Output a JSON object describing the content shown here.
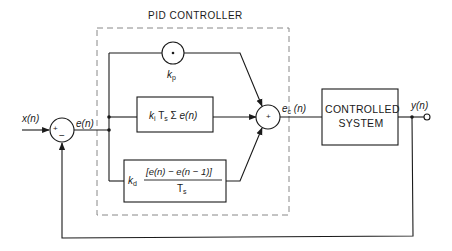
{
  "diagram": {
    "title": "PID CONTROLLER",
    "input_signal": "x(n)",
    "error_signal": "e(n)",
    "controller_output": "e_c(n)",
    "output_signal": "y(n)",
    "input_sum": {
      "plus_sign": "+",
      "minus_sign": "−"
    },
    "output_sum": {
      "plus_sign": "+"
    },
    "proportional": {
      "operator": "·",
      "gain": "k_p"
    },
    "integral": {
      "gain": "k_i",
      "expression": "T_s Σ e(n)"
    },
    "derivative": {
      "gain": "k_d",
      "numerator": "[e(n) − e(n − 1)]",
      "denominator": "T_s"
    },
    "plant": {
      "line1": "CONTROLLED",
      "line2": "SYSTEM"
    },
    "colors": {
      "line": "#1a1a1a",
      "dashed": "#888888",
      "background": "#ffffff"
    }
  }
}
